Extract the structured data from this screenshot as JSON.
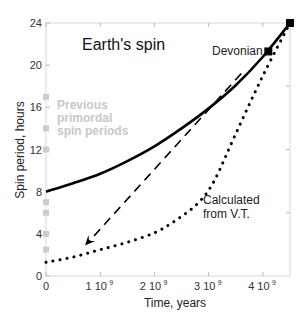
{
  "chart_data": {
    "type": "line",
    "title": "Earth's spin",
    "xlabel": "Time, years",
    "ylabel": "Spin period, hours",
    "xlim": [
      0,
      4500000000.0
    ],
    "ylim": [
      0,
      24
    ],
    "x_ticks": [
      0,
      1000000000.0,
      2000000000.0,
      3000000000.0,
      4000000000.0
    ],
    "x_tick_labels": [
      "0",
      "1 10",
      "2 10",
      "3 10",
      "4 10"
    ],
    "x_tick_exponent": "9",
    "y_ticks": [
      0,
      4,
      8,
      12,
      16,
      20,
      24
    ],
    "y_tick_labels": [
      "0",
      "4",
      "8",
      "12",
      "16",
      "20",
      "24"
    ],
    "grid": false,
    "series": [
      {
        "name": "Spin period history (solid)",
        "style": "solid",
        "color": "#000000",
        "x": [
          0,
          500000000.0,
          1000000000.0,
          1500000000.0,
          2000000000.0,
          2500000000.0,
          3000000000.0,
          3500000000.0,
          4000000000.0,
          4500000000.0
        ],
        "values": [
          8,
          8.8,
          9.7,
          10.9,
          12.3,
          14.0,
          15.9,
          18.1,
          20.8,
          24
        ]
      },
      {
        "name": "Calculated from V.T.",
        "style": "dotted",
        "color": "#000000",
        "x": [
          0,
          500000000.0,
          1000000000.0,
          1500000000.0,
          2000000000.0,
          2400000000.0,
          2800000000.0,
          3100000000.0,
          3500000000.0,
          4000000000.0,
          4500000000.0
        ],
        "values": [
          1.3,
          1.8,
          2.5,
          3.2,
          4.1,
          5.3,
          6.9,
          9.0,
          13.5,
          19.0,
          24
        ]
      },
      {
        "name": "Previous primordal spin periods",
        "style": "markers",
        "color": "#cccccc",
        "x": [
          0,
          0,
          0,
          0,
          0,
          0,
          0
        ],
        "values": [
          17,
          14,
          12,
          7,
          6,
          4,
          2.5
        ]
      }
    ],
    "markers": [
      {
        "label": "Devonian",
        "x": 4100000000.0,
        "y": 21.3,
        "shape": "square",
        "color": "#000000"
      },
      {
        "label": "",
        "x": 4500000000.0,
        "y": 24,
        "shape": "square",
        "color": "#000000"
      }
    ],
    "arrow": {
      "style": "dashed",
      "from": [
        3600000000.0,
        19.2
      ],
      "to": [
        720000000.0,
        2.9
      ]
    },
    "annotations": [
      {
        "text": "Earth's spin"
      },
      {
        "text": "Devonian"
      },
      {
        "text_lines": [
          "Previous",
          "primordal",
          "spin periods"
        ],
        "color": "#c8c8c8"
      },
      {
        "text_lines": [
          "Calculated",
          "from V.T."
        ]
      }
    ]
  },
  "labels": {
    "title": "Earth's spin",
    "xlabel": "Time, years",
    "ylabel": "Spin period, hours",
    "devonian": "Devonian",
    "prev1": "Previous",
    "prev2": "primordal",
    "prev3": "spin periods",
    "calc1": "Calculated",
    "calc2": "from V.T.",
    "exp": "9"
  }
}
